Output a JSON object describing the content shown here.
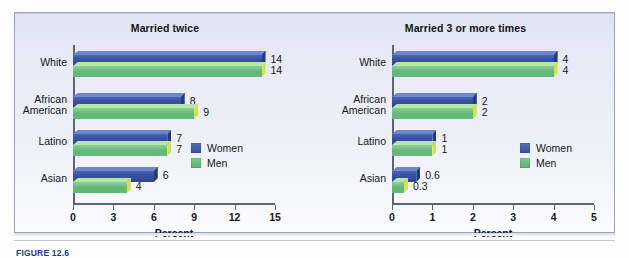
{
  "figure": {
    "caption_label": "FIGURE 12.6",
    "caption_text": ""
  },
  "legend": {
    "women_label": "Women",
    "men_label": "Men",
    "women_color": "#36509f",
    "men_color": "#63b878"
  },
  "chart_data": [
    {
      "type": "bar",
      "orientation": "horizontal",
      "title": "Married twice",
      "xlabel": "Percent",
      "ylabel": "",
      "xlim": [
        0,
        15
      ],
      "xticks": [
        0,
        3,
        6,
        9,
        12,
        15
      ],
      "xticklabels": [
        "0",
        "3",
        "6",
        "9",
        "12",
        "15"
      ],
      "grid": false,
      "legend_position": "center-right",
      "categories": [
        "White",
        "African American",
        "Latino",
        "Asian"
      ],
      "series": [
        {
          "name": "Women",
          "color": "#36509f",
          "values": [
            14,
            8,
            7,
            6
          ],
          "labels": [
            "14",
            "8",
            "7",
            "6"
          ]
        },
        {
          "name": "Men",
          "color": "#63b878",
          "values": [
            14,
            9,
            7,
            4
          ],
          "labels": [
            "14",
            "9",
            "7",
            "4"
          ]
        }
      ]
    },
    {
      "type": "bar",
      "orientation": "horizontal",
      "title": "Married 3 or more times",
      "xlabel": "Percent",
      "ylabel": "",
      "xlim": [
        0,
        5
      ],
      "xticks": [
        0,
        1,
        2,
        3,
        4,
        5
      ],
      "xticklabels": [
        "0",
        "1",
        "2",
        "3",
        "4",
        "5"
      ],
      "grid": false,
      "legend_position": "center-right",
      "categories": [
        "White",
        "African American",
        "Latino",
        "Asian"
      ],
      "series": [
        {
          "name": "Women",
          "color": "#36509f",
          "values": [
            4,
            2,
            1,
            0.6
          ],
          "labels": [
            "4",
            "2",
            "1",
            "0.6"
          ]
        },
        {
          "name": "Men",
          "color": "#63b878",
          "values": [
            4,
            2,
            1,
            0.3
          ],
          "labels": [
            "4",
            "2",
            "1",
            "0.3"
          ]
        }
      ]
    }
  ]
}
